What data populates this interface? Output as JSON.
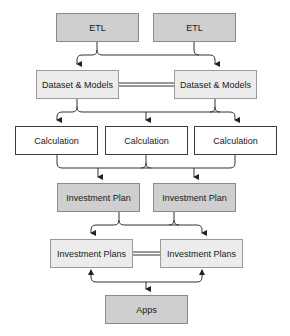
{
  "diagram": {
    "nodes": {
      "etl_1": {
        "label": "ETL"
      },
      "etl_2": {
        "label": "ETL"
      },
      "dataset_1": {
        "label": "Dataset & Models"
      },
      "dataset_2": {
        "label": "Dataset & Models"
      },
      "calc_1": {
        "label": "Calculation"
      },
      "calc_2": {
        "label": "Calculation"
      },
      "calc_3": {
        "label": "Calculation"
      },
      "plan_1": {
        "label": "Investment Plan"
      },
      "plan_2": {
        "label": "Investment Plan"
      },
      "plans_1": {
        "label": "Investment Plans"
      },
      "plans_2": {
        "label": "Investment Plans"
      },
      "apps": {
        "label": "Apps"
      }
    },
    "edges": [
      {
        "from": "etl_1",
        "to": [
          "dataset_1",
          "dataset_2"
        ],
        "type": "arrow"
      },
      {
        "from": "etl_2",
        "to": [
          "dataset_1",
          "dataset_2"
        ],
        "type": "arrow"
      },
      {
        "from": "dataset_1",
        "to": "dataset_2",
        "type": "double-line"
      },
      {
        "from": "dataset_1",
        "to": [
          "calc_1",
          "calc_2",
          "calc_3"
        ],
        "type": "arrow"
      },
      {
        "from": "dataset_2",
        "to": [
          "calc_1",
          "calc_2",
          "calc_3"
        ],
        "type": "arrow"
      },
      {
        "from": [
          "calc_1",
          "calc_2",
          "calc_3"
        ],
        "to": [
          "plan_1",
          "plan_2"
        ],
        "type": "arrow"
      },
      {
        "from": "plan_1",
        "to": [
          "plans_1",
          "plans_2"
        ],
        "type": "arrow"
      },
      {
        "from": "plan_2",
        "to": [
          "plans_1",
          "plans_2"
        ],
        "type": "arrow"
      },
      {
        "from": "plans_1",
        "to": "plans_2",
        "type": "double-line"
      },
      {
        "from": "apps",
        "to": [
          "plans_1",
          "plans_2"
        ],
        "type": "bidirectional-arrow"
      }
    ],
    "colors": {
      "dark_fill": "#cfcfcf",
      "light_fill": "#ececec",
      "white_fill": "#ffffff",
      "edge": "#333333"
    }
  }
}
